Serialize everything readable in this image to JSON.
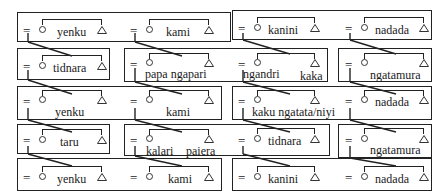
{
  "diagram": {
    "type": "kinship-section-diagram",
    "symbols": {
      "marriage": "=",
      "female": "circle",
      "male": "triangle"
    },
    "rows": [
      {
        "boxes": [
          {
            "couples": [
              {
                "inside_label": "yenku"
              },
              {
                "inside_label": "kami"
              }
            ]
          },
          {
            "couples": [
              {
                "inside_label": "kanini"
              },
              {
                "inside_label": "nadada"
              }
            ]
          }
        ]
      },
      {
        "boxes": [
          {
            "couples": [
              {
                "inside_label": "tidnara"
              }
            ]
          },
          {
            "couples": [
              {
                "below_label": "papa ngapari"
              },
              {
                "below_label_left": "ngandri",
                "below_label_right": "kaka"
              }
            ]
          },
          {
            "couples": [
              {
                "below_label": "ngatamura"
              }
            ]
          }
        ]
      },
      {
        "boxes": [
          {
            "couples": [
              {
                "below_label": "yenku"
              },
              {
                "below_label": "kami"
              }
            ]
          },
          {
            "couples": [
              {
                "below_label": "kaku ngatata/niyi"
              },
              {
                "inside_label": "nadada"
              }
            ]
          }
        ]
      },
      {
        "boxes": [
          {
            "couples": [
              {
                "inside_label": "taru"
              }
            ]
          },
          {
            "couples": [
              {
                "below_label_left": "kalari",
                "below_label_right": "paiera"
              },
              {
                "inside_label": "tidnara"
              }
            ]
          },
          {
            "couples": [
              {
                "below_label": "ngatamura"
              }
            ]
          }
        ]
      },
      {
        "boxes": [
          {
            "couples": [
              {
                "inside_label": "yenku"
              },
              {
                "inside_label": "kami"
              }
            ]
          },
          {
            "couples": [
              {
                "inside_label": "kanini"
              },
              {
                "inside_label": "nadada"
              }
            ]
          }
        ]
      }
    ]
  },
  "labels": {
    "eq": "=",
    "r1_yenku": "yenku",
    "r1_kami": "kami",
    "r1_kanini": "kanini",
    "r1_nadada": "nadada",
    "r2_tidnara": "tidnara",
    "r2_papa_ngapari": "papa  ngapari",
    "r2_ngandri": "ngandri",
    "r2_kaka": "kaka",
    "r2_ngatamura": "ngatamura",
    "r3_yenku": "yenku",
    "r3_kami": "kami",
    "r3_kaku": "kaku  ngatata/niyi",
    "r3_nadada": "nadada",
    "r4_taru": "taru",
    "r4_kalari": "kalari",
    "r4_paiera": "paiera",
    "r4_tidnara": "tidnara",
    "r4_ngatamura": "ngatamura",
    "r5_yenku": "yenku",
    "r5_kami": "kami",
    "r5_kanini": "kanini",
    "r5_nadada": "nadada"
  }
}
